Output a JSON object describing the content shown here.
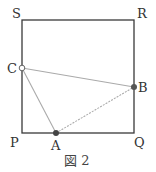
{
  "figure": {
    "caption": "図 2",
    "square": {
      "vertices": {
        "S": "S",
        "R": "R",
        "Q": "Q",
        "P": "P"
      },
      "stroke_color": "#3a3a3a"
    },
    "points": {
      "A": {
        "label": "A",
        "style": "filled",
        "on_side": "PQ"
      },
      "B": {
        "label": "B",
        "style": "filled",
        "on_side": "QR"
      },
      "C": {
        "label": "C",
        "style": "open",
        "on_side": "PS"
      }
    },
    "triangle": {
      "edges": [
        "CA",
        "CB",
        "AB"
      ],
      "edge_color": "#aaaaaa",
      "dashed_edge": "AB"
    }
  }
}
